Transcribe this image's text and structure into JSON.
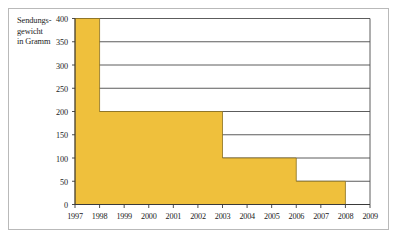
{
  "figure": {
    "axis_title_lines": [
      "Sendungs-",
      "gewicht",
      "in Gramm"
    ],
    "caption": ""
  },
  "colors": {
    "fill": "#efc03c",
    "fill_edge": "#8a7020",
    "axis": "#3a3a3a",
    "gridline": "#4a4a4a",
    "frame": "#b9b9b9",
    "text": "#1c1c1c"
  },
  "chart_data": {
    "type": "area",
    "title": "",
    "subtitle": "",
    "xlabel": "",
    "ylabel": "Sendungsgewicht in Gramm",
    "x": [
      1997,
      1998,
      1999,
      2000,
      2001,
      2002,
      2003,
      2004,
      2005,
      2006,
      2007,
      2008,
      2009
    ],
    "xtick_labels": [
      "1997",
      "1998",
      "1999",
      "2000",
      "2001",
      "2002",
      "2003",
      "2004",
      "2005",
      "2006",
      "2007",
      "2008",
      "2009"
    ],
    "ytick_labels": [
      "0",
      "50",
      "100",
      "150",
      "200",
      "250",
      "300",
      "350",
      "400"
    ],
    "yticks": [
      0,
      50,
      100,
      150,
      200,
      250,
      300,
      350,
      400
    ],
    "ylim": [
      0,
      400
    ],
    "xlim": [
      1997,
      2009
    ],
    "grid": true,
    "legend": null,
    "step_mode": "post",
    "series": [
      {
        "name": "Sendungsgewicht",
        "steps": [
          {
            "x_start": 1997,
            "x_end": 1998,
            "value": 400
          },
          {
            "x_start": 1998,
            "x_end": 2003,
            "value": 200
          },
          {
            "x_start": 2003,
            "x_end": 2006,
            "value": 100
          },
          {
            "x_start": 2006,
            "x_end": 2008,
            "value": 50
          },
          {
            "x_start": 2008,
            "x_end": 2009,
            "value": 0
          }
        ],
        "values": [
          400,
          200,
          200,
          200,
          200,
          200,
          100,
          100,
          100,
          50,
          50,
          0,
          0
        ]
      }
    ]
  }
}
